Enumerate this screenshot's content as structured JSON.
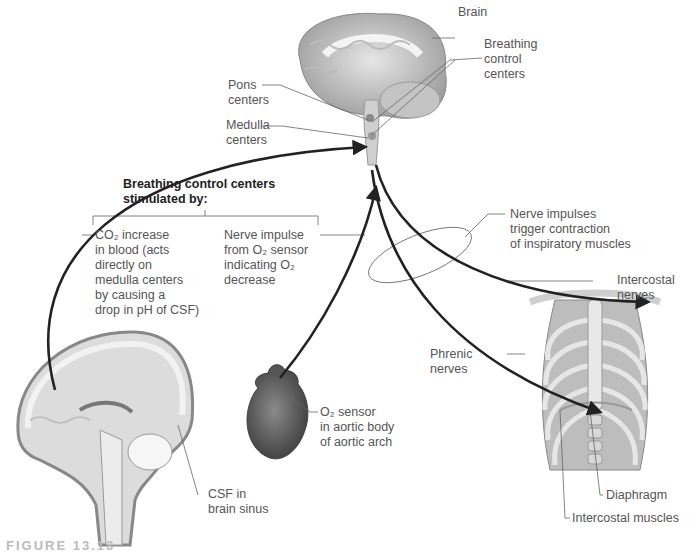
{
  "labels": {
    "brain": "Brain",
    "breathing_control_centers": [
      "Breathing",
      "control",
      "centers"
    ],
    "pons_centers": [
      "Pons",
      "centers"
    ],
    "medulla_centers": [
      "Medulla",
      "centers"
    ],
    "heading": [
      "Breathing control centers",
      "stimulated by:"
    ],
    "co2_stimulus": [
      "CO₂ increase",
      "in blood (acts",
      "directly on",
      "medulla centers",
      "by causing a",
      "drop in pH of CSF)"
    ],
    "nerve_impulse_stimulus": [
      "Nerve impulse",
      "from O₂ sensor",
      "indicating O₂",
      "decrease"
    ],
    "nerve_impulses_trigger": [
      "Nerve impulses",
      "trigger contraction",
      "of inspiratory muscles"
    ],
    "intercostal_nerves": [
      "Intercostal",
      "nerves"
    ],
    "phrenic_nerves": [
      "Phrenic",
      "nerves"
    ],
    "o2_sensor": [
      "O₂ sensor",
      "in aortic body",
      "of aortic arch"
    ],
    "csf": [
      "CSF in",
      "brain sinus"
    ],
    "diaphragm": "Diaphragm",
    "intercostal_muscles": "Intercostal muscles"
  },
  "caption": "FIGURE 13.13",
  "colors": {
    "arrow": "#222222",
    "leader": "#666666",
    "tissue_light": "#d6d6d6",
    "tissue_mid": "#aaaaaa",
    "tissue_dark": "#777777"
  }
}
